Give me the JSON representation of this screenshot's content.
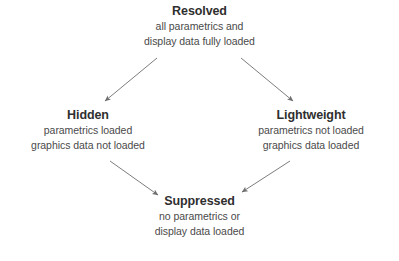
{
  "diagram": {
    "type": "state-flow-diagram",
    "shape": "diamond",
    "background_color": "#ffffff",
    "text_color": "#3a3a3a",
    "title_color": "#2f2f2f",
    "arrow_color": "#7d7d7d",
    "nodes": [
      {
        "id": "resolved",
        "title": "Resolved",
        "lines": [
          "all parametrics and",
          "display data fully loaded"
        ],
        "position": "top"
      },
      {
        "id": "hidden",
        "title": "Hidden",
        "lines": [
          "parametrics loaded",
          "graphics data not loaded"
        ],
        "position": "left"
      },
      {
        "id": "lightweight",
        "title": "Lightweight",
        "lines": [
          "parametrics not loaded",
          "graphics data loaded"
        ],
        "position": "right"
      },
      {
        "id": "suppressed",
        "title": "Suppressed",
        "lines": [
          "no parametrics or",
          "display data loaded"
        ],
        "position": "bottom"
      }
    ],
    "edges": [
      {
        "id": "resolved-to-hidden",
        "from": "resolved",
        "to": "hidden"
      },
      {
        "id": "resolved-to-lightweight",
        "from": "resolved",
        "to": "lightweight"
      },
      {
        "id": "hidden-to-suppressed",
        "from": "hidden",
        "to": "suppressed"
      },
      {
        "id": "lightweight-to-suppressed",
        "from": "lightweight",
        "to": "suppressed"
      }
    ]
  }
}
